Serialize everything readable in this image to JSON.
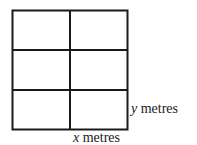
{
  "diagram": {
    "grid": {
      "columns": 2,
      "rows": 3
    },
    "stroke_color": "#1a1a1a",
    "labels": {
      "height": {
        "variable": "y",
        "unit": "metres"
      },
      "width": {
        "variable": "x",
        "unit": "metres"
      }
    }
  }
}
